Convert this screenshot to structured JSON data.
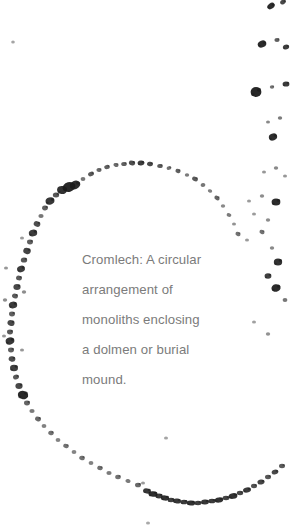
{
  "page": {
    "width": 290,
    "height": 531,
    "background_color": "#ffffff"
  },
  "caption": {
    "text": "Cromlech: A circular\narrangement of\nmonoliths enclosing\na dolmen or burial\nmound.",
    "lines": [
      "Cromlech: A circular",
      "arrangement of",
      "monoliths enclosing",
      "a dolmen or burial",
      "mound."
    ],
    "term": "Cromlech",
    "definition": "A circular arrangement of monoliths enclosing a dolmen or burial mound.",
    "color": "#7b7b7b",
    "font_size_px": 13.2,
    "line_height_px": 30
  },
  "illustration": {
    "subject": "cromlech",
    "description": "Stippled dark stone marks arranged in a large circle with scattered outlying stones along the right edge",
    "stone_color": "#1c1c1c",
    "faint_stone_color": "#9a9a9a",
    "circle": {
      "center_x": 118,
      "center_y": 330,
      "radius_x": 132,
      "radius_y": 168
    },
    "ring_stones": [
      {
        "x": 150,
        "y": 164,
        "w": 3.0,
        "h": 2.2,
        "r": 12,
        "o": 0.8
      },
      {
        "x": 141,
        "y": 163,
        "w": 3.4,
        "h": 2.4,
        "r": -8,
        "o": 0.85
      },
      {
        "x": 132,
        "y": 163,
        "w": 3.2,
        "h": 2.3,
        "r": 20,
        "o": 0.78
      },
      {
        "x": 124,
        "y": 164,
        "w": 2.8,
        "h": 2.0,
        "r": 0,
        "o": 0.7
      },
      {
        "x": 116,
        "y": 165,
        "w": 2.6,
        "h": 2.0,
        "r": 15,
        "o": 0.65
      },
      {
        "x": 160,
        "y": 166,
        "w": 2.8,
        "h": 2.1,
        "r": 5,
        "o": 0.72
      },
      {
        "x": 169,
        "y": 168,
        "w": 2.4,
        "h": 1.9,
        "r": -10,
        "o": 0.62
      },
      {
        "x": 178,
        "y": 171,
        "w": 2.6,
        "h": 2.0,
        "r": 18,
        "o": 0.7
      },
      {
        "x": 187,
        "y": 175,
        "w": 2.2,
        "h": 1.8,
        "r": 0,
        "o": 0.58
      },
      {
        "x": 195,
        "y": 179,
        "w": 3.0,
        "h": 2.2,
        "r": 25,
        "o": 0.72
      },
      {
        "x": 203,
        "y": 185,
        "w": 2.4,
        "h": 1.9,
        "r": -5,
        "o": 0.6
      },
      {
        "x": 210,
        "y": 191,
        "w": 2.2,
        "h": 1.7,
        "r": 10,
        "o": 0.55
      },
      {
        "x": 217,
        "y": 198,
        "w": 2.8,
        "h": 2.1,
        "r": 30,
        "o": 0.68
      },
      {
        "x": 223,
        "y": 206,
        "w": 2.2,
        "h": 1.7,
        "r": 0,
        "o": 0.52
      },
      {
        "x": 229,
        "y": 215,
        "w": 2.4,
        "h": 1.8,
        "r": 15,
        "o": 0.58
      },
      {
        "x": 234,
        "y": 224,
        "w": 2.0,
        "h": 1.6,
        "r": 0,
        "o": 0.48
      },
      {
        "x": 238,
        "y": 234,
        "w": 2.6,
        "h": 2.0,
        "r": 20,
        "o": 0.62
      },
      {
        "x": 107,
        "y": 167,
        "w": 2.8,
        "h": 2.1,
        "r": -12,
        "o": 0.7
      },
      {
        "x": 99,
        "y": 170,
        "w": 2.6,
        "h": 2.0,
        "r": 8,
        "o": 0.66
      },
      {
        "x": 91,
        "y": 174,
        "w": 3.0,
        "h": 2.2,
        "r": -20,
        "o": 0.72
      },
      {
        "x": 83,
        "y": 179,
        "w": 2.4,
        "h": 1.9,
        "r": 0,
        "o": 0.6
      },
      {
        "x": 75,
        "y": 185,
        "w": 5.5,
        "h": 4.2,
        "r": -25,
        "o": 0.92
      },
      {
        "x": 69,
        "y": 187,
        "w": 6.5,
        "h": 4.8,
        "r": -15,
        "o": 0.95
      },
      {
        "x": 62,
        "y": 190,
        "w": 5.0,
        "h": 4.0,
        "r": 10,
        "o": 0.9
      },
      {
        "x": 56,
        "y": 195,
        "w": 3.2,
        "h": 2.5,
        "r": 0,
        "o": 0.74
      },
      {
        "x": 50,
        "y": 201,
        "w": 4.5,
        "h": 3.6,
        "r": -18,
        "o": 0.88
      },
      {
        "x": 45,
        "y": 208,
        "w": 3.0,
        "h": 2.4,
        "r": 5,
        "o": 0.7
      },
      {
        "x": 41,
        "y": 216,
        "w": 2.6,
        "h": 2.0,
        "r": 0,
        "o": 0.6
      },
      {
        "x": 37,
        "y": 224,
        "w": 3.4,
        "h": 2.7,
        "r": 22,
        "o": 0.78
      },
      {
        "x": 33,
        "y": 233,
        "w": 4.2,
        "h": 3.4,
        "r": -10,
        "o": 0.86
      },
      {
        "x": 30,
        "y": 242,
        "w": 3.0,
        "h": 2.4,
        "r": 0,
        "o": 0.7
      },
      {
        "x": 27,
        "y": 251,
        "w": 3.8,
        "h": 3.0,
        "r": 15,
        "o": 0.82
      },
      {
        "x": 24,
        "y": 260,
        "w": 3.2,
        "h": 2.6,
        "r": 0,
        "o": 0.74
      },
      {
        "x": 21,
        "y": 269,
        "w": 4.0,
        "h": 3.2,
        "r": -20,
        "o": 0.85
      },
      {
        "x": 19,
        "y": 278,
        "w": 3.0,
        "h": 2.4,
        "r": 10,
        "o": 0.72
      },
      {
        "x": 17,
        "y": 287,
        "w": 3.6,
        "h": 2.9,
        "r": 0,
        "o": 0.8
      },
      {
        "x": 15,
        "y": 296,
        "w": 3.0,
        "h": 2.4,
        "r": 18,
        "o": 0.72
      },
      {
        "x": 13,
        "y": 305,
        "w": 4.2,
        "h": 3.4,
        "r": -12,
        "o": 0.86
      },
      {
        "x": 12,
        "y": 314,
        "w": 3.0,
        "h": 2.4,
        "r": 0,
        "o": 0.7
      },
      {
        "x": 11,
        "y": 323,
        "w": 3.6,
        "h": 2.9,
        "r": 20,
        "o": 0.8
      },
      {
        "x": 10,
        "y": 332,
        "w": 3.0,
        "h": 2.4,
        "r": 0,
        "o": 0.72
      },
      {
        "x": 10,
        "y": 341,
        "w": 4.4,
        "h": 3.5,
        "r": -15,
        "o": 0.88
      },
      {
        "x": 11,
        "y": 350,
        "w": 3.0,
        "h": 2.4,
        "r": 0,
        "o": 0.7
      },
      {
        "x": 12,
        "y": 359,
        "w": 3.4,
        "h": 2.7,
        "r": 12,
        "o": 0.78
      },
      {
        "x": 14,
        "y": 368,
        "w": 4.0,
        "h": 3.2,
        "r": 0,
        "o": 0.84
      },
      {
        "x": 16,
        "y": 377,
        "w": 3.0,
        "h": 2.4,
        "r": -18,
        "o": 0.72
      },
      {
        "x": 19,
        "y": 386,
        "w": 3.6,
        "h": 2.9,
        "r": 0,
        "o": 0.8
      },
      {
        "x": 23,
        "y": 395,
        "w": 5.2,
        "h": 4.2,
        "r": 14,
        "o": 0.94
      },
      {
        "x": 27,
        "y": 403,
        "w": 3.0,
        "h": 2.4,
        "r": 0,
        "o": 0.68
      },
      {
        "x": 32,
        "y": 411,
        "w": 2.6,
        "h": 2.0,
        "r": 0,
        "o": 0.58
      },
      {
        "x": 38,
        "y": 419,
        "w": 3.0,
        "h": 2.3,
        "r": 20,
        "o": 0.66
      },
      {
        "x": 44,
        "y": 426,
        "w": 2.4,
        "h": 1.9,
        "r": 0,
        "o": 0.55
      },
      {
        "x": 51,
        "y": 433,
        "w": 2.8,
        "h": 2.2,
        "r": 10,
        "o": 0.62
      },
      {
        "x": 58,
        "y": 440,
        "w": 2.4,
        "h": 1.9,
        "r": 0,
        "o": 0.54
      },
      {
        "x": 66,
        "y": 446,
        "w": 2.8,
        "h": 2.1,
        "r": 15,
        "o": 0.62
      },
      {
        "x": 74,
        "y": 452,
        "w": 2.4,
        "h": 1.9,
        "r": 0,
        "o": 0.54
      },
      {
        "x": 82,
        "y": 458,
        "w": 2.8,
        "h": 2.2,
        "r": 8,
        "o": 0.62
      },
      {
        "x": 91,
        "y": 463,
        "w": 2.4,
        "h": 1.9,
        "r": 0,
        "o": 0.55
      },
      {
        "x": 100,
        "y": 468,
        "w": 2.8,
        "h": 2.2,
        "r": 18,
        "o": 0.63
      },
      {
        "x": 109,
        "y": 473,
        "w": 2.6,
        "h": 2.0,
        "r": 0,
        "o": 0.58
      },
      {
        "x": 118,
        "y": 477,
        "w": 2.8,
        "h": 2.2,
        "r": 0,
        "o": 0.62
      },
      {
        "x": 128,
        "y": 481,
        "w": 2.6,
        "h": 2.0,
        "r": 12,
        "o": 0.58
      },
      {
        "x": 138,
        "y": 485,
        "w": 3.0,
        "h": 2.3,
        "r": 0,
        "o": 0.66
      },
      {
        "x": 147,
        "y": 491,
        "w": 4.0,
        "h": 2.6,
        "r": 10,
        "o": 0.88
      },
      {
        "x": 153,
        "y": 494,
        "w": 4.6,
        "h": 2.8,
        "r": 5,
        "o": 0.92
      },
      {
        "x": 159,
        "y": 496,
        "w": 3.6,
        "h": 2.4,
        "r": 0,
        "o": 0.86
      },
      {
        "x": 165,
        "y": 498,
        "w": 4.2,
        "h": 2.6,
        "r": 8,
        "o": 0.9
      },
      {
        "x": 171,
        "y": 500,
        "w": 3.4,
        "h": 2.2,
        "r": 0,
        "o": 0.84
      },
      {
        "x": 177,
        "y": 501,
        "w": 4.0,
        "h": 2.5,
        "r": 6,
        "o": 0.88
      },
      {
        "x": 184,
        "y": 502,
        "w": 3.6,
        "h": 2.3,
        "r": 0,
        "o": 0.86
      },
      {
        "x": 191,
        "y": 503,
        "w": 4.2,
        "h": 2.6,
        "r": 4,
        "o": 0.9
      },
      {
        "x": 198,
        "y": 503,
        "w": 3.4,
        "h": 2.2,
        "r": 0,
        "o": 0.84
      },
      {
        "x": 205,
        "y": 502,
        "w": 4.0,
        "h": 2.5,
        "r": -4,
        "o": 0.88
      },
      {
        "x": 212,
        "y": 501,
        "w": 3.6,
        "h": 2.3,
        "r": 0,
        "o": 0.86
      },
      {
        "x": 219,
        "y": 500,
        "w": 4.2,
        "h": 2.6,
        "r": -6,
        "o": 0.9
      },
      {
        "x": 226,
        "y": 498,
        "w": 3.4,
        "h": 2.2,
        "r": 0,
        "o": 0.82
      },
      {
        "x": 233,
        "y": 496,
        "w": 4.4,
        "h": 2.8,
        "r": -8,
        "o": 0.9
      },
      {
        "x": 240,
        "y": 493,
        "w": 3.2,
        "h": 2.2,
        "r": 0,
        "o": 0.8
      },
      {
        "x": 247,
        "y": 490,
        "w": 4.0,
        "h": 2.6,
        "r": -10,
        "o": 0.86
      },
      {
        "x": 254,
        "y": 486,
        "w": 3.0,
        "h": 2.2,
        "r": 0,
        "o": 0.76
      },
      {
        "x": 261,
        "y": 482,
        "w": 3.6,
        "h": 2.5,
        "r": -12,
        "o": 0.82
      },
      {
        "x": 268,
        "y": 477,
        "w": 3.0,
        "h": 2.2,
        "r": 0,
        "o": 0.74
      },
      {
        "x": 275,
        "y": 472,
        "w": 3.4,
        "h": 2.4,
        "r": -15,
        "o": 0.8
      },
      {
        "x": 282,
        "y": 466,
        "w": 3.0,
        "h": 2.2,
        "r": 0,
        "o": 0.72
      }
    ],
    "scatter_stones": [
      {
        "x": 271,
        "y": 6,
        "w": 4.0,
        "h": 2.8,
        "r": -35,
        "o": 0.92
      },
      {
        "x": 283,
        "y": 2,
        "w": 3.0,
        "h": 2.2,
        "r": -30,
        "o": 0.8
      },
      {
        "x": 262,
        "y": 44,
        "w": 4.4,
        "h": 3.4,
        "r": -25,
        "o": 0.93
      },
      {
        "x": 277,
        "y": 40,
        "w": 2.6,
        "h": 2.0,
        "r": 0,
        "o": 0.7
      },
      {
        "x": 286,
        "y": 47,
        "w": 3.2,
        "h": 2.4,
        "r": -20,
        "o": 0.84
      },
      {
        "x": 256,
        "y": 92,
        "w": 5.4,
        "h": 5.0,
        "r": 0,
        "o": 0.95
      },
      {
        "x": 272,
        "y": 87,
        "w": 2.2,
        "h": 1.8,
        "r": 0,
        "o": 0.62
      },
      {
        "x": 286,
        "y": 84,
        "w": 3.4,
        "h": 2.6,
        "r": 0,
        "o": 0.86
      },
      {
        "x": 268,
        "y": 122,
        "w": 2.0,
        "h": 1.6,
        "r": 0,
        "o": 0.52
      },
      {
        "x": 280,
        "y": 118,
        "w": 2.2,
        "h": 1.8,
        "r": 0,
        "o": 0.58
      },
      {
        "x": 273,
        "y": 137,
        "w": 4.2,
        "h": 3.4,
        "r": -20,
        "o": 0.92
      },
      {
        "x": 264,
        "y": 172,
        "w": 2.0,
        "h": 1.6,
        "r": 0,
        "o": 0.46
      },
      {
        "x": 276,
        "y": 168,
        "w": 2.2,
        "h": 1.7,
        "r": 0,
        "o": 0.52
      },
      {
        "x": 285,
        "y": 176,
        "w": 2.0,
        "h": 1.6,
        "r": 0,
        "o": 0.46
      },
      {
        "x": 249,
        "y": 201,
        "w": 2.0,
        "h": 1.6,
        "r": 0,
        "o": 0.44
      },
      {
        "x": 262,
        "y": 196,
        "w": 2.2,
        "h": 1.7,
        "r": 0,
        "o": 0.5
      },
      {
        "x": 276,
        "y": 202,
        "w": 4.4,
        "h": 3.6,
        "r": 0,
        "o": 0.93
      },
      {
        "x": 254,
        "y": 214,
        "w": 2.0,
        "h": 1.6,
        "r": 0,
        "o": 0.44
      },
      {
        "x": 268,
        "y": 220,
        "w": 2.2,
        "h": 1.8,
        "r": 0,
        "o": 0.5
      },
      {
        "x": 262,
        "y": 232,
        "w": 2.6,
        "h": 2.0,
        "r": 20,
        "o": 0.62
      },
      {
        "x": 247,
        "y": 240,
        "w": 2.0,
        "h": 1.6,
        "r": 0,
        "o": 0.44
      },
      {
        "x": 272,
        "y": 248,
        "w": 2.2,
        "h": 1.8,
        "r": 0,
        "o": 0.52
      },
      {
        "x": 278,
        "y": 262,
        "w": 4.2,
        "h": 3.6,
        "r": 0,
        "o": 0.9
      },
      {
        "x": 268,
        "y": 276,
        "w": 3.4,
        "h": 2.8,
        "r": 0,
        "o": 0.84
      },
      {
        "x": 276,
        "y": 288,
        "w": 4.6,
        "h": 3.8,
        "r": -10,
        "o": 0.93
      },
      {
        "x": 285,
        "y": 300,
        "w": 2.4,
        "h": 1.9,
        "r": 0,
        "o": 0.6
      },
      {
        "x": 13,
        "y": 42,
        "w": 1.8,
        "h": 1.5,
        "r": 0,
        "o": 0.4
      },
      {
        "x": 254,
        "y": 322,
        "w": 2.0,
        "h": 1.6,
        "r": 0,
        "o": 0.42
      },
      {
        "x": 268,
        "y": 334,
        "w": 2.2,
        "h": 1.7,
        "r": 0,
        "o": 0.48
      },
      {
        "x": 166,
        "y": 438,
        "w": 2.0,
        "h": 1.6,
        "r": 0,
        "o": 0.4
      },
      {
        "x": 143,
        "y": 483,
        "w": 2.0,
        "h": 1.6,
        "r": 0,
        "o": 0.44
      },
      {
        "x": 148,
        "y": 523,
        "w": 2.0,
        "h": 1.6,
        "r": 0,
        "o": 0.38
      },
      {
        "x": 6,
        "y": 268,
        "w": 2.0,
        "h": 1.6,
        "r": 0,
        "o": 0.46
      },
      {
        "x": 5,
        "y": 300,
        "w": 2.2,
        "h": 1.8,
        "r": 0,
        "o": 0.5
      },
      {
        "x": 4,
        "y": 336,
        "w": 2.0,
        "h": 1.6,
        "r": 0,
        "o": 0.46
      },
      {
        "x": 22,
        "y": 238,
        "w": 2.0,
        "h": 1.6,
        "r": 0,
        "o": 0.44
      },
      {
        "x": 24,
        "y": 292,
        "w": 2.2,
        "h": 1.8,
        "r": 0,
        "o": 0.5
      },
      {
        "x": 22,
        "y": 350,
        "w": 2.0,
        "h": 1.6,
        "r": 0,
        "o": 0.46
      }
    ]
  }
}
